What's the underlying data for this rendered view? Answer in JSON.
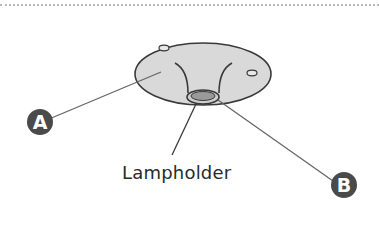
{
  "diagram": {
    "labels": {
      "lampholder": "Lampholder",
      "marker_a": "A",
      "marker_b": "B"
    },
    "colors": {
      "rose_fill": "#d9d9d9",
      "outline": "#3a3a3a",
      "marker_fill": "#4a4a4a",
      "leader_line": "#666666",
      "rule": "#b8b8b8"
    }
  }
}
